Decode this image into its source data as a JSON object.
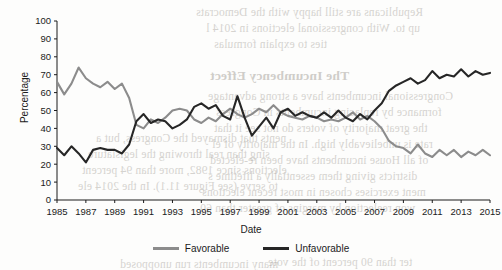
{
  "figure": {
    "x_axis_title": "Date",
    "y_axis_title": "Percentage"
  },
  "legend": {
    "position": "bottom-center",
    "items": [
      {
        "label": "Favorable",
        "color": "#8c8c8c",
        "key": "favorable"
      },
      {
        "label": "Unfavorable",
        "color": "#262626",
        "key": "unfavorable"
      }
    ]
  },
  "colors": {
    "favorable": "#8c8c8c",
    "unfavorable": "#262626",
    "axis": "#1b1b1b",
    "page": "#fdfdfc",
    "bleed_text": "#9a958e"
  },
  "background_text": {
    "note": "faint show-through text from the opposite side of the scanned book page",
    "lines": [
      {
        "text": "Republicans are still happy with the Democrats",
        "x": 196,
        "y": 6,
        "size": 11.5,
        "bold": false
      },
      {
        "text": "up to. With congressional elections in 2014 l",
        "x": 206,
        "y": 22,
        "size": 11.5,
        "bold": false
      },
      {
        "text": "ties to explain formulas",
        "x": 214,
        "y": 38,
        "size": 11.5,
        "bold": false
      },
      {
        "text": "The Incumbency Effect",
        "x": 210,
        "y": 68,
        "size": 13.5,
        "bold": true
      },
      {
        "text": "Congressional incumbents have a strong advantage",
        "x": 208,
        "y": 90,
        "size": 11.5,
        "bold": false
      },
      {
        "text": "formance by replacing incumbents in Congress",
        "x": 216,
        "y": 106,
        "size": 11.5,
        "bold": false
      },
      {
        "text": "the great majority of voters do not see it that",
        "x": 214,
        "y": 122,
        "size": 11.5,
        "bold": false
      },
      {
        "text": "rate is unbelievably high. In the majority of el",
        "x": 212,
        "y": 138,
        "size": 11.5,
        "bold": false
      },
      {
        "text": "of all House incumbents have been re-elected",
        "x": 210,
        "y": 154,
        "size": 11.5,
        "bold": false
      },
      {
        "text": "districts giving them essentially a lifetime s",
        "x": 208,
        "y": 170,
        "size": 11.5,
        "bold": false
      },
      {
        "text": "ment exercises chosen in most recent elections",
        "x": 202,
        "y": 186,
        "size": 11.5,
        "bold": false
      },
      {
        "text": "won reelection by margins of greater than 60",
        "x": 200,
        "y": 202,
        "size": 11.5,
        "bold": false
      },
      {
        "text": "nents that dismayed the Congress, but a",
        "x": 96,
        "y": 132,
        "size": 11.5,
        "bold": false
      },
      {
        "text": "sing than real throwing the legislature",
        "x": 88,
        "y": 148,
        "size": 11.5,
        "bold": false
      },
      {
        "text": "elections since 1982, more than 94 percent",
        "x": 82,
        "y": 164,
        "size": 11.5,
        "bold": false
      },
      {
        "text": "to serve (see Figure 11.1). In the 2014 ele",
        "x": 78,
        "y": 180,
        "size": 11.5,
        "bold": false
      },
      {
        "text": "ter than 90 percent of the vote",
        "x": 268,
        "y": 256,
        "size": 11.5,
        "bold": false
      },
      {
        "text": "many incumbents run unopposed",
        "x": 120,
        "y": 258,
        "size": 11.5,
        "bold": false
      }
    ]
  },
  "chart_data": {
    "type": "line",
    "title": "",
    "xlabel": "Date",
    "ylabel": "Percentage",
    "xlim": [
      1985,
      2015
    ],
    "ylim": [
      0,
      100
    ],
    "yticks": [
      0,
      10,
      20,
      30,
      40,
      50,
      60,
      70,
      80,
      90,
      100
    ],
    "xticks": [
      1985,
      1987,
      1989,
      1991,
      1993,
      1995,
      1997,
      1999,
      2001,
      2003,
      2005,
      2007,
      2009,
      2011,
      2013,
      2015
    ],
    "grid": false,
    "legend_position": "bottom-center",
    "x": [
      1985,
      1985.5,
      1986,
      1986.5,
      1987,
      1987.5,
      1988,
      1988.5,
      1989,
      1989.5,
      1990,
      1990.5,
      1991,
      1991.5,
      1992,
      1992.5,
      1993,
      1993.5,
      1994,
      1994.5,
      1995,
      1995.5,
      1996,
      1996.5,
      1997,
      1997.5,
      1998,
      1998.5,
      1999,
      1999.5,
      2000,
      2000.5,
      2001,
      2001.5,
      2002,
      2002.5,
      2003,
      2003.5,
      2004,
      2004.5,
      2005,
      2005.5,
      2006,
      2006.5,
      2007,
      2007.5,
      2008,
      2008.5,
      2009,
      2009.5,
      2010,
      2010.5,
      2011,
      2011.5,
      2012,
      2012.5,
      2013,
      2013.5,
      2014,
      2014.5,
      2015
    ],
    "series": [
      {
        "name": "Favorable",
        "color": "#8c8c8c",
        "values": [
          66,
          59,
          65,
          74,
          68,
          65,
          63,
          66,
          62,
          65,
          57,
          42,
          40,
          45,
          43,
          46,
          50,
          51,
          50,
          45,
          43,
          46,
          44,
          48,
          51,
          48,
          46,
          48,
          51,
          49,
          53,
          49,
          47,
          46,
          45,
          47,
          46,
          44,
          45,
          44,
          46,
          49,
          45,
          47,
          44,
          40,
          33,
          30,
          29,
          26,
          31,
          26,
          24,
          28,
          25,
          28,
          24,
          27,
          25,
          28,
          25
        ]
      },
      {
        "name": "Unfavorable",
        "color": "#262626",
        "values": [
          29,
          25,
          30,
          26,
          21,
          28,
          29,
          28,
          28,
          26,
          31,
          44,
          48,
          43,
          45,
          44,
          40,
          42,
          45,
          52,
          54,
          51,
          53,
          47,
          45,
          58,
          46,
          36,
          41,
          46,
          40,
          49,
          51,
          47,
          49,
          47,
          46,
          49,
          46,
          50,
          46,
          44,
          48,
          45,
          50,
          54,
          61,
          64,
          66,
          68,
          65,
          67,
          72,
          68,
          70,
          69,
          73,
          69,
          72,
          70,
          71
        ]
      }
    ]
  }
}
